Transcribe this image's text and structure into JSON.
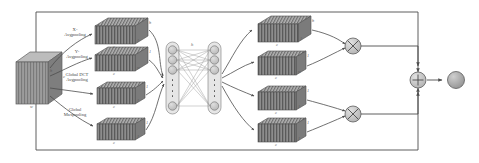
{
  "diagram": {
    "input": {
      "name": "input-feature-cube",
      "dim_w": "w",
      "dim_h": "h",
      "dim_c": "c"
    },
    "pool_labels": [
      {
        "name": "x-avgpooling",
        "line1": "X-",
        "line2": "Avgpooling"
      },
      {
        "name": "y-avgpooling",
        "line1": "Y-",
        "line2": "Avgpooling"
      },
      {
        "name": "global-dct-avgpooling",
        "line1": "Global DCT",
        "line2": "Avgpooling"
      },
      {
        "name": "global-maxpooling",
        "line1": "Global",
        "line2": "Maxpooling"
      }
    ],
    "left_blocks": [
      {
        "name": "left-block-1",
        "c": "c",
        "h": "h",
        "w": "1"
      },
      {
        "name": "left-block-2",
        "c": "c",
        "h": "1",
        "w": "w"
      },
      {
        "name": "left-block-3",
        "c": "c",
        "h": "1",
        "w": "1"
      },
      {
        "name": "left-block-4",
        "c": "c",
        "h": "1",
        "w": "1"
      }
    ],
    "mlp": {
      "name": "shared-mlp",
      "hidden_label": "h",
      "nodes_per_layer": 4
    },
    "right_blocks": [
      {
        "name": "right-block-1",
        "c": "c",
        "h": "h",
        "w": "1"
      },
      {
        "name": "right-block-2",
        "c": "c",
        "h": "1",
        "w": "w"
      },
      {
        "name": "right-block-3",
        "c": "c",
        "h": "1",
        "w": "1"
      },
      {
        "name": "right-block-4",
        "c": "c",
        "h": "1",
        "w": "1"
      }
    ],
    "operators": [
      {
        "name": "multiply-top",
        "glyph": "×"
      },
      {
        "name": "multiply-bottom",
        "glyph": "×"
      },
      {
        "name": "add-node",
        "glyph": "+"
      }
    ],
    "output": {
      "name": "output-feature",
      "label": ""
    },
    "colors": {
      "line": "#4d4d4d",
      "block_fill": "#8f8f8f",
      "block_top": "#b5b5b5",
      "block_stripe": "#5e5e5e",
      "cube_front": "#9a9a9a",
      "cube_top": "#bcbcbc",
      "cube_side": "#7e7e7e",
      "node_fill": "#c9c9c9",
      "node_stroke": "#6d6d6d",
      "op_fill": "#c2c2c2",
      "output_fill": "#a8a8a8",
      "text": "#4a4a4a"
    }
  }
}
